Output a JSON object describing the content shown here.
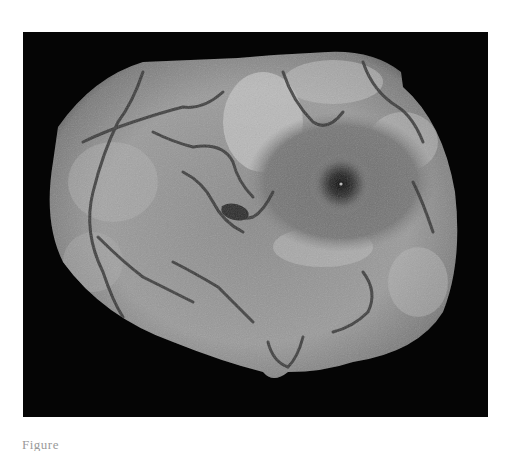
{
  "figure": {
    "type": "grayscale retinal fundus mosaic",
    "background": "#050505",
    "fovea": {
      "x": 318,
      "y": 152
    },
    "caption": "Figure"
  }
}
